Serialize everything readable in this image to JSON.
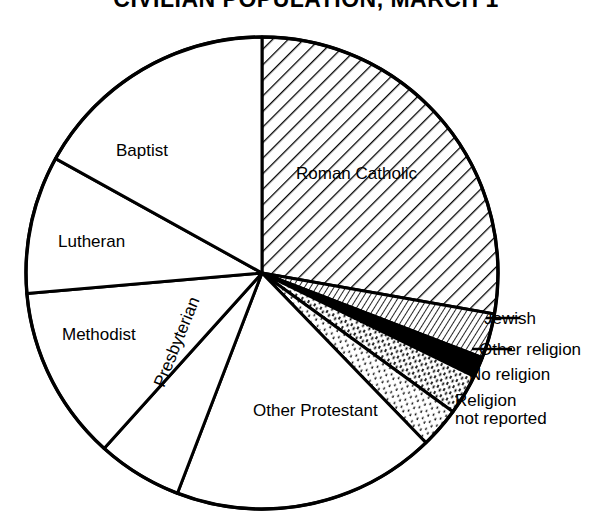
{
  "title": "CIVILIAN POPULATION, MARCH 1",
  "chart_data": {
    "type": "pie",
    "title": "CIVILIAN POPULATION, MARCH 1",
    "xlabel": "",
    "ylabel": "",
    "legend_position": "none",
    "grid": false,
    "categories": [
      "Roman Catholic",
      "Jewish",
      "Other religion",
      "No religion",
      "Religion not reported",
      "Other Protestant",
      "Presbyterian",
      "Methodist",
      "Lutheran",
      "Baptist"
    ],
    "values": [
      27.8,
      3.1,
      1.4,
      2.7,
      2.9,
      18.1,
      5.8,
      11.9,
      9.4,
      16.9
    ],
    "slices": [
      {
        "label": "Roman Catholic",
        "value": 27.8,
        "start_angle": 0,
        "end_angle": 100,
        "pattern": "diagonal-hatch",
        "color": "#ffffff",
        "label_placement": "inside"
      },
      {
        "label": "Jewish",
        "value": 3.1,
        "start_angle": 100,
        "end_angle": 111,
        "pattern": "fine-diagonal-lines",
        "color": "#ffffff",
        "label_placement": "outside-right"
      },
      {
        "label": "Other religion",
        "value": 1.4,
        "start_angle": 111,
        "end_angle": 116,
        "pattern": "solid-black",
        "color": "#000000",
        "label_placement": "outside-right"
      },
      {
        "label": "No religion",
        "value": 2.7,
        "start_angle": 116,
        "end_angle": 126,
        "pattern": "dense-stipple",
        "color": "#ffffff",
        "label_placement": "outside-right"
      },
      {
        "label": "Religion not reported",
        "value": 2.9,
        "start_angle": 126,
        "end_angle": 136,
        "pattern": "light-stipple",
        "color": "#ffffff",
        "label_placement": "outside-right",
        "line_1": "Religion",
        "line_2": "not reported"
      },
      {
        "label": "Other Protestant",
        "value": 18.1,
        "start_angle": 136,
        "end_angle": 201,
        "pattern": "none",
        "color": "#ffffff",
        "label_placement": "inside"
      },
      {
        "label": "Presbyterian",
        "value": 5.8,
        "start_angle": 201,
        "end_angle": 222,
        "pattern": "none",
        "color": "#ffffff",
        "label_placement": "inside-rotated"
      },
      {
        "label": "Methodist",
        "value": 11.9,
        "start_angle": 222,
        "end_angle": 265,
        "pattern": "none",
        "color": "#ffffff",
        "label_placement": "inside"
      },
      {
        "label": "Lutheran",
        "value": 9.4,
        "start_angle": 265,
        "end_angle": 299,
        "pattern": "none",
        "color": "#ffffff",
        "label_placement": "inside"
      },
      {
        "label": "Baptist",
        "value": 16.9,
        "start_angle": 299,
        "end_angle": 360,
        "pattern": "none",
        "color": "#ffffff",
        "label_placement": "inside"
      }
    ],
    "geometry": {
      "center_x": 262,
      "center_y": 273,
      "radius": 236,
      "start_at_twelve_oclock": true,
      "direction": "clockwise"
    },
    "style": {
      "outline_color": "#000000",
      "background": "#ffffff",
      "black_fill": "#000000"
    }
  },
  "labels": {
    "roman_catholic": "Roman Catholic",
    "jewish": "Jewish",
    "other_religion": "Other religion",
    "no_religion": "No religion",
    "religion_not_reported_line1": "Religion",
    "religion_not_reported_line2": "not reported",
    "other_protestant": "Other Protestant",
    "presbyterian": "Presbyterian",
    "methodist": "Methodist",
    "lutheran": "Lutheran",
    "baptist": "Baptist"
  }
}
